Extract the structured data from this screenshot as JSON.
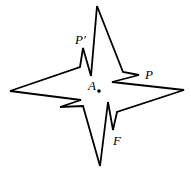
{
  "diagram": {
    "title": "",
    "labels": {
      "center": "A",
      "point_p": "P",
      "point_p_prime": "P′",
      "point_f": "F"
    },
    "colors": {
      "stroke": "#000000",
      "background": "#ffffff"
    }
  }
}
